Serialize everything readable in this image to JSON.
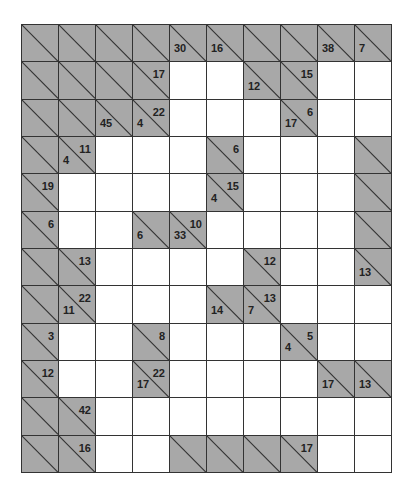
{
  "puzzle": {
    "type": "kakuro",
    "rows": 12,
    "cols": 10,
    "colors": {
      "block": "#a8a8a8",
      "white": "#ffffff",
      "line": "#333333",
      "text": "#222222"
    },
    "grid": [
      [
        {
          "t": "B"
        },
        {
          "t": "B"
        },
        {
          "t": "B"
        },
        {
          "t": "B"
        },
        {
          "t": "C",
          "d": "30"
        },
        {
          "t": "C",
          "d": "16"
        },
        {
          "t": "B"
        },
        {
          "t": "B"
        },
        {
          "t": "C",
          "d": "38"
        },
        {
          "t": "C",
          "d": "7"
        }
      ],
      [
        {
          "t": "B"
        },
        {
          "t": "B"
        },
        {
          "t": "B"
        },
        {
          "t": "C",
          "a": "17"
        },
        {
          "t": "W"
        },
        {
          "t": "W"
        },
        {
          "t": "C",
          "d": "12"
        },
        {
          "t": "C",
          "a": "15"
        },
        {
          "t": "W"
        },
        {
          "t": "W"
        }
      ],
      [
        {
          "t": "B"
        },
        {
          "t": "B"
        },
        {
          "t": "C",
          "d": "45"
        },
        {
          "t": "C",
          "d": "4",
          "a": "22"
        },
        {
          "t": "W"
        },
        {
          "t": "W"
        },
        {
          "t": "W"
        },
        {
          "t": "C",
          "d": "17",
          "a": "6"
        },
        {
          "t": "W"
        },
        {
          "t": "W"
        }
      ],
      [
        {
          "t": "B"
        },
        {
          "t": "C",
          "d": "4",
          "a": "11"
        },
        {
          "t": "W"
        },
        {
          "t": "W"
        },
        {
          "t": "W"
        },
        {
          "t": "C",
          "a": "6"
        },
        {
          "t": "W"
        },
        {
          "t": "W"
        },
        {
          "t": "W"
        },
        {
          "t": "B"
        }
      ],
      [
        {
          "t": "C",
          "a": "19"
        },
        {
          "t": "W"
        },
        {
          "t": "W"
        },
        {
          "t": "W"
        },
        {
          "t": "W"
        },
        {
          "t": "C",
          "d": "4",
          "a": "15"
        },
        {
          "t": "W"
        },
        {
          "t": "W"
        },
        {
          "t": "W"
        },
        {
          "t": "B"
        }
      ],
      [
        {
          "t": "C",
          "a": "6"
        },
        {
          "t": "W"
        },
        {
          "t": "W"
        },
        {
          "t": "C",
          "d": "6"
        },
        {
          "t": "C",
          "d": "33",
          "a": "10"
        },
        {
          "t": "W"
        },
        {
          "t": "W"
        },
        {
          "t": "W"
        },
        {
          "t": "W"
        },
        {
          "t": "B"
        }
      ],
      [
        {
          "t": "B"
        },
        {
          "t": "C",
          "a": "13"
        },
        {
          "t": "W"
        },
        {
          "t": "W"
        },
        {
          "t": "W"
        },
        {
          "t": "W"
        },
        {
          "t": "C",
          "a": "12"
        },
        {
          "t": "W"
        },
        {
          "t": "W"
        },
        {
          "t": "C",
          "d": "13"
        }
      ],
      [
        {
          "t": "B"
        },
        {
          "t": "C",
          "d": "11",
          "a": "22"
        },
        {
          "t": "W"
        },
        {
          "t": "W"
        },
        {
          "t": "W"
        },
        {
          "t": "C",
          "d": "14"
        },
        {
          "t": "C",
          "d": "7",
          "a": "13"
        },
        {
          "t": "W"
        },
        {
          "t": "W"
        },
        {
          "t": "W"
        }
      ],
      [
        {
          "t": "C",
          "a": "3"
        },
        {
          "t": "W"
        },
        {
          "t": "W"
        },
        {
          "t": "C",
          "a": "8"
        },
        {
          "t": "W"
        },
        {
          "t": "W"
        },
        {
          "t": "W"
        },
        {
          "t": "C",
          "d": "4",
          "a": "5"
        },
        {
          "t": "W"
        },
        {
          "t": "W"
        }
      ],
      [
        {
          "t": "C",
          "a": "12"
        },
        {
          "t": "W"
        },
        {
          "t": "W"
        },
        {
          "t": "C",
          "d": "17",
          "a": "22"
        },
        {
          "t": "W"
        },
        {
          "t": "W"
        },
        {
          "t": "W"
        },
        {
          "t": "W"
        },
        {
          "t": "C",
          "d": "17"
        },
        {
          "t": "C",
          "d": "13"
        }
      ],
      [
        {
          "t": "B"
        },
        {
          "t": "C",
          "a": "42"
        },
        {
          "t": "W"
        },
        {
          "t": "W"
        },
        {
          "t": "W"
        },
        {
          "t": "W"
        },
        {
          "t": "W"
        },
        {
          "t": "W"
        },
        {
          "t": "W"
        },
        {
          "t": "W"
        }
      ],
      [
        {
          "t": "B"
        },
        {
          "t": "C",
          "a": "16"
        },
        {
          "t": "W"
        },
        {
          "t": "W"
        },
        {
          "t": "B"
        },
        {
          "t": "B"
        },
        {
          "t": "B"
        },
        {
          "t": "C",
          "a": "17"
        },
        {
          "t": "W"
        },
        {
          "t": "W"
        }
      ]
    ]
  }
}
